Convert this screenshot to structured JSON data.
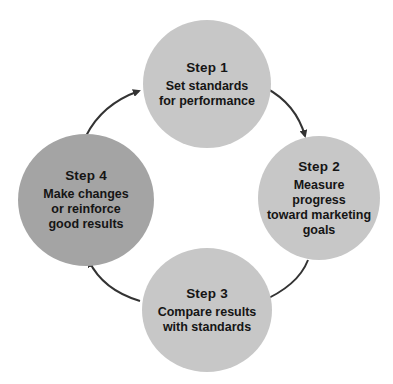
{
  "diagram": {
    "type": "cycle",
    "colors": {
      "light_circle": "#c7c7c7",
      "dark_circle": "#a4a4a4",
      "text": "#151515",
      "arrow": "#333333",
      "background": "#ffffff"
    },
    "steps": [
      {
        "title": "Step 1",
        "text": "Set standards\nfor performance"
      },
      {
        "title": "Step 2",
        "text": "Measure\nprogress\ntoward marketing\ngoals"
      },
      {
        "title": "Step 3",
        "text": "Compare results\nwith standards"
      },
      {
        "title": "Step 4",
        "text": "Make changes\nor reinforce\ngood results"
      }
    ],
    "flow": [
      "Step 1 -> Step 2",
      "Step 2 -> Step 3",
      "Step 3 -> Step 4",
      "Step 4 -> Step 1"
    ]
  }
}
